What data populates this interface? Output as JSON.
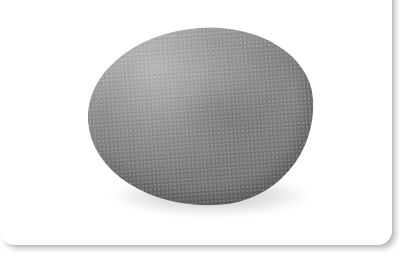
{
  "image": {
    "subject": "smooth gray stone",
    "background_color": "#ffffff",
    "card": {
      "color": "#ffffff",
      "shadow_color": "#c8c8c8"
    },
    "stone": {
      "base_color": "#808080",
      "highlight_color": "#9a9a9a",
      "shade_color": "#6c6c6c",
      "texture": "speckled granite"
    }
  }
}
